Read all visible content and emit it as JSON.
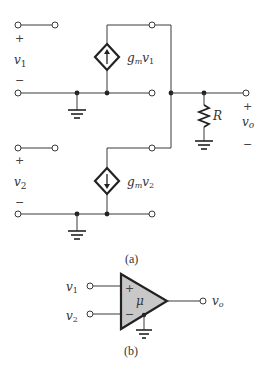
{
  "figure_a": {
    "caption": "(a)",
    "input1": {
      "plus": "+",
      "minus": "−",
      "var": "v",
      "sub": "1"
    },
    "input2": {
      "plus": "+",
      "minus": "−",
      "var": "v",
      "sub": "2"
    },
    "source1": {
      "gain": "g",
      "gain_sub": "m",
      "var": "v",
      "sub": "1",
      "direction": "up"
    },
    "source2": {
      "gain": "g",
      "gain_sub": "m",
      "var": "v",
      "sub": "2",
      "direction": "down"
    },
    "resistor": {
      "label": "R"
    },
    "output": {
      "plus": "+",
      "minus": "−",
      "var": "v",
      "sub": "o"
    }
  },
  "figure_b": {
    "caption": "(b)",
    "input1": {
      "var": "v",
      "sub": "1"
    },
    "input2": {
      "var": "v",
      "sub": "2"
    },
    "plus": "+",
    "minus": "−",
    "gain": "μ",
    "output": {
      "var": "v",
      "sub": "o"
    }
  }
}
